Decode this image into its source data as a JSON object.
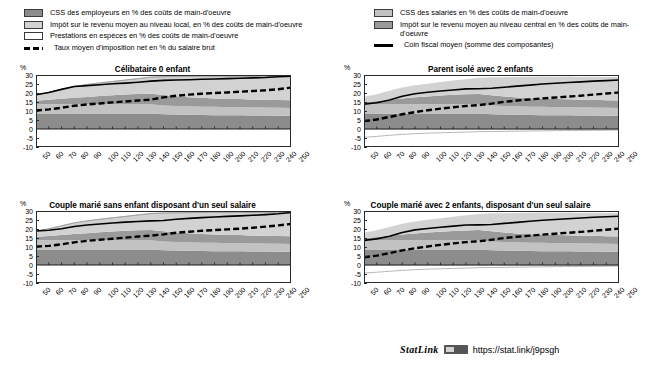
{
  "legend": {
    "left_items": [
      {
        "swatch": "dark",
        "label": "CSS des employeurs en % des coûts de main-d'oeuvre"
      },
      {
        "swatch": "lightgray",
        "label": "Impôt sur le revenu moyen au niveau local, en % des coûts de main-d'oeuvre"
      },
      {
        "swatch": "white",
        "label": "Prestations en espèces en % des coûts de main-d'oeuvre"
      },
      {
        "swatch": "dash",
        "label": "Taux moyen d'imposition net en % du salaire brut"
      }
    ],
    "right_items": [
      {
        "swatch": "midlight",
        "label": "CSS des salariés en % des coûts de main-d'oeuvre"
      },
      {
        "swatch": "mid",
        "label": "Impôt sur le revenu moyen au niveau central en %  des coûts de main-d'oeuvre"
      },
      {
        "swatch": "line",
        "label": "Coin fiscal moyen (somme des composantes)"
      }
    ]
  },
  "axis": {
    "unit": "%",
    "yticks": [
      30,
      25,
      20,
      15,
      10,
      5,
      0,
      -5,
      -10
    ],
    "ylim": [
      -10,
      30
    ],
    "xticks": [
      "50",
      "60",
      "70",
      "80",
      "90",
      "100",
      "110",
      "120",
      "130",
      "140",
      "150",
      "160",
      "170",
      "180",
      "190",
      "200",
      "210",
      "220",
      "230",
      "240",
      "250"
    ]
  },
  "footer": {
    "statlink_word": "StatLink",
    "icon": "spreadsheet-icon",
    "url": "https://stat.link/j9psgh"
  },
  "colors": {
    "employer_scc": "#8c8c8c",
    "employee_scc": "#c2c2c2",
    "central_tax": "#9a9a9a",
    "local_tax": "#d2d2d2",
    "cash_benefits": "#ffffff",
    "net_rate_line": "#000000",
    "wedge_line": "#000000"
  },
  "chart_data": [
    {
      "id": "celibataire-0-enfant",
      "type": "area",
      "title": "Célibataire 0 enfant",
      "xlabel": "",
      "ylabel": "%",
      "ylim": [
        -10,
        30
      ],
      "grid": false,
      "legend_position": "top",
      "x": [
        50,
        60,
        70,
        80,
        90,
        100,
        110,
        120,
        130,
        140,
        150,
        160,
        170,
        180,
        190,
        200,
        210,
        220,
        230,
        240,
        250
      ],
      "series": [
        {
          "name": "CSS des employeurs en % des coûts de main-d'oeuvre",
          "stack": true,
          "order": 1,
          "values": [
            8.6,
            8.6,
            8.6,
            8.6,
            8.6,
            8.6,
            8.6,
            8.6,
            8.6,
            8.6,
            8.2,
            8.0,
            7.9,
            7.8,
            7.7,
            7.6,
            7.6,
            7.5,
            7.5,
            7.4,
            7.4
          ]
        },
        {
          "name": "CSS des salariés en % des coûts de main-d'oeuvre",
          "stack": true,
          "order": 2,
          "values": [
            5.1,
            5.1,
            5.1,
            5.1,
            5.1,
            5.1,
            5.1,
            5.1,
            5.1,
            5.1,
            4.9,
            4.8,
            4.7,
            4.6,
            4.6,
            4.5,
            4.5,
            4.4,
            4.4,
            4.4,
            4.3
          ]
        },
        {
          "name": "Impôt sur le revenu moyen au niveau central en % des coûts de main-d'oeuvre",
          "stack": true,
          "order": 3,
          "values": [
            2.0,
            2.5,
            3.1,
            3.6,
            4.1,
            4.6,
            5.0,
            5.4,
            5.7,
            5.9,
            5.8,
            5.4,
            5.1,
            4.9,
            4.7,
            4.6,
            4.5,
            4.4,
            4.4,
            4.3,
            4.3
          ]
        },
        {
          "name": "Impôt sur le revenu moyen au niveau local en % des coûts de main-d'oeuvre",
          "stack": true,
          "order": 4,
          "values": [
            3.3,
            4.1,
            5.2,
            6.3,
            6.9,
            7.3,
            7.7,
            8.1,
            8.6,
            9.2,
            10.2,
            11.0,
            11.6,
            12.1,
            12.4,
            12.6,
            12.8,
            12.9,
            13.0,
            13.1,
            13.2
          ]
        },
        {
          "name": "Prestations en espèces en % des coûts de main-d'oeuvre",
          "stack": true,
          "order": 5,
          "values": [
            0,
            0,
            0,
            0,
            0,
            0,
            0,
            0,
            0,
            0,
            0,
            0,
            0,
            0,
            0,
            0,
            0,
            0,
            0,
            0,
            0
          ]
        }
      ],
      "lines": [
        {
          "name": "Coin fiscal moyen (somme des composantes)",
          "style": "solid",
          "values": [
            19.0,
            20.3,
            22.0,
            23.6,
            24.1,
            24.6,
            25.1,
            25.5,
            26.0,
            26.6,
            27.0,
            27.2,
            27.4,
            27.6,
            27.8,
            28.0,
            28.2,
            28.4,
            28.6,
            29.0,
            29.4
          ]
        },
        {
          "name": "Taux moyen d'imposition net en % du salaire brut",
          "style": "dashed",
          "values": [
            10.3,
            10.9,
            11.8,
            12.9,
            13.6,
            14.2,
            14.8,
            15.3,
            15.8,
            16.3,
            17.6,
            18.5,
            19.1,
            19.6,
            20.0,
            20.3,
            20.7,
            21.1,
            21.5,
            22.1,
            23.0
          ]
        }
      ]
    },
    {
      "id": "parent-isole-2-enfants",
      "type": "area",
      "title": "Parent isolé avec 2 enfants",
      "xlabel": "",
      "ylabel": "%",
      "ylim": [
        -10,
        30
      ],
      "grid": false,
      "legend_position": "top",
      "x": [
        50,
        60,
        70,
        80,
        90,
        100,
        110,
        120,
        130,
        140,
        150,
        160,
        170,
        180,
        190,
        200,
        210,
        220,
        230,
        240,
        250
      ],
      "series": [
        {
          "name": "CSS des employeurs en % des coûts de main-d'oeuvre",
          "stack": true,
          "order": 1,
          "values": [
            8.6,
            8.6,
            8.6,
            8.6,
            8.6,
            8.6,
            8.6,
            8.6,
            8.6,
            8.6,
            8.2,
            8.0,
            7.9,
            7.8,
            7.7,
            7.6,
            7.6,
            7.5,
            7.5,
            7.4,
            7.4
          ]
        },
        {
          "name": "CSS des salariés en % des coûts de main-d'oeuvre",
          "stack": true,
          "order": 2,
          "values": [
            5.1,
            5.1,
            5.1,
            5.1,
            5.1,
            5.1,
            5.1,
            5.1,
            5.1,
            5.1,
            4.9,
            4.8,
            4.7,
            4.6,
            4.6,
            4.5,
            4.5,
            4.4,
            4.4,
            4.4,
            4.3
          ]
        },
        {
          "name": "Impôt sur le revenu moyen au niveau central en % des coûts de main-d'oeuvre",
          "stack": true,
          "order": 3,
          "values": [
            1.2,
            1.8,
            2.6,
            3.3,
            3.9,
            4.4,
            4.9,
            5.3,
            5.6,
            5.8,
            5.6,
            5.2,
            4.9,
            4.7,
            4.6,
            4.5,
            4.4,
            4.3,
            4.3,
            4.2,
            4.2
          ]
        },
        {
          "name": "Impôt sur le revenu moyen au niveau local en % des coûts de main-d'oeuvre",
          "stack": true,
          "order": 4,
          "values": [
            3.0,
            3.8,
            4.9,
            6.0,
            6.7,
            7.1,
            7.5,
            7.9,
            8.4,
            9.0,
            10.0,
            10.8,
            11.4,
            11.9,
            12.2,
            12.4,
            12.6,
            12.7,
            12.8,
            12.9,
            13.0
          ]
        },
        {
          "name": "Prestations en espèces en % des coûts de main-d'oeuvre",
          "stack": true,
          "order": 5,
          "values": [
            -4.6,
            -4.1,
            -3.5,
            -3.0,
            -2.6,
            -2.3,
            -2.1,
            -1.9,
            -1.7,
            -1.5,
            -1.4,
            -1.3,
            -1.2,
            -1.1,
            -1.0,
            -0.9,
            -0.8,
            -0.8,
            -0.7,
            -0.7,
            -0.6
          ]
        }
      ],
      "lines": [
        {
          "name": "Coin fiscal moyen (somme des composantes)",
          "style": "solid",
          "values": [
            13.8,
            14.6,
            16.1,
            18.2,
            19.6,
            20.4,
            21.1,
            21.7,
            22.3,
            22.4,
            22.6,
            23.2,
            23.8,
            24.4,
            25.0,
            25.4,
            25.8,
            26.2,
            26.6,
            26.9,
            27.2
          ]
        },
        {
          "name": "Taux moyen d'imposition net en % du salaire brut",
          "style": "dashed",
          "values": [
            4.4,
            5.3,
            6.7,
            8.2,
            9.4,
            10.4,
            11.3,
            12.1,
            12.8,
            13.3,
            14.1,
            15.1,
            15.8,
            16.4,
            17.0,
            17.5,
            18.0,
            18.5,
            19.1,
            19.7,
            20.3
          ]
        }
      ]
    },
    {
      "id": "couple-marie-sans-enfant",
      "type": "area",
      "title": "Couple marié sans enfant disposant d'un seul salaire",
      "xlabel": "",
      "ylabel": "%",
      "ylim": [
        -10,
        30
      ],
      "grid": false,
      "legend_position": "top",
      "x": [
        50,
        60,
        70,
        80,
        90,
        100,
        110,
        120,
        130,
        140,
        150,
        160,
        170,
        180,
        190,
        200,
        210,
        220,
        230,
        240,
        250
      ],
      "series": [
        {
          "name": "CSS des employeurs en % des coûts de main-d'oeuvre",
          "stack": true,
          "order": 1,
          "values": [
            8.6,
            8.6,
            8.6,
            8.6,
            8.6,
            8.6,
            8.6,
            8.6,
            8.6,
            8.6,
            8.2,
            8.0,
            7.9,
            7.8,
            7.7,
            7.6,
            7.6,
            7.5,
            7.5,
            7.4,
            7.4
          ]
        },
        {
          "name": "CSS des salariés en % des coûts de main-d'oeuvre",
          "stack": true,
          "order": 2,
          "values": [
            5.1,
            5.1,
            5.1,
            5.1,
            5.1,
            5.1,
            5.1,
            5.1,
            5.1,
            5.1,
            4.9,
            4.8,
            4.7,
            4.6,
            4.6,
            4.5,
            4.5,
            4.4,
            4.4,
            4.4,
            4.3
          ]
        },
        {
          "name": "Impôt sur le revenu moyen au niveau central en % des coûts de main-d'oeuvre",
          "stack": true,
          "order": 3,
          "values": [
            2.0,
            2.4,
            3.0,
            3.5,
            4.0,
            4.5,
            4.9,
            5.3,
            5.6,
            5.8,
            5.7,
            5.3,
            5.0,
            4.8,
            4.7,
            4.6,
            4.5,
            4.4,
            4.4,
            4.3,
            4.3
          ]
        },
        {
          "name": "Impôt sur le revenu moyen au niveau local en % des coûts de main-d'oeuvre",
          "stack": true,
          "order": 4,
          "values": [
            3.2,
            4.0,
            5.1,
            6.2,
            6.8,
            7.2,
            7.6,
            8.0,
            8.5,
            9.1,
            10.1,
            10.9,
            11.5,
            12.0,
            12.3,
            12.5,
            12.7,
            12.8,
            13.0,
            13.2,
            13.4
          ]
        },
        {
          "name": "Prestations en espèces en % des coûts de main-d'oeuvre",
          "stack": true,
          "order": 5,
          "values": [
            0,
            0,
            0,
            0,
            0,
            0,
            0,
            0,
            0,
            0,
            0,
            0,
            0,
            0,
            0,
            0,
            0,
            0,
            0,
            0,
            0
          ]
        }
      ],
      "lines": [
        {
          "name": "Coin fiscal moyen (somme des composantes)",
          "style": "solid",
          "values": [
            18.9,
            19.3,
            20.1,
            21.4,
            22.2,
            22.8,
            23.3,
            23.8,
            24.2,
            24.5,
            24.7,
            25.4,
            25.9,
            26.3,
            26.7,
            27.0,
            27.3,
            27.6,
            28.0,
            28.5,
            29.2
          ]
        },
        {
          "name": "Taux moyen d'imposition net en % du salaire brut",
          "style": "dashed",
          "values": [
            10.2,
            10.6,
            11.5,
            12.6,
            13.4,
            14.0,
            14.6,
            15.2,
            15.8,
            16.3,
            17.0,
            17.9,
            18.5,
            19.0,
            19.4,
            19.8,
            20.2,
            20.7,
            21.3,
            22.0,
            22.8
          ]
        }
      ]
    },
    {
      "id": "couple-marie-2-enfants",
      "type": "area",
      "title": "Couple marié avec 2 enfants, disposant d'un seul salaire",
      "xlabel": "",
      "ylabel": "%",
      "ylim": [
        -10,
        30
      ],
      "grid": false,
      "legend_position": "top",
      "x": [
        50,
        60,
        70,
        80,
        90,
        100,
        110,
        120,
        130,
        140,
        150,
        160,
        170,
        180,
        190,
        200,
        210,
        220,
        230,
        240,
        250
      ],
      "series": [
        {
          "name": "CSS des employeurs en % des coûts de main-d'oeuvre",
          "stack": true,
          "order": 1,
          "values": [
            8.6,
            8.6,
            8.6,
            8.6,
            8.6,
            8.6,
            8.6,
            8.6,
            8.6,
            8.6,
            8.2,
            8.0,
            7.9,
            7.8,
            7.7,
            7.6,
            7.6,
            7.5,
            7.5,
            7.4,
            7.4
          ]
        },
        {
          "name": "CSS des salariés en % des coûts de main-d'oeuvre",
          "stack": true,
          "order": 2,
          "values": [
            5.1,
            5.1,
            5.1,
            5.1,
            5.1,
            5.1,
            5.1,
            5.1,
            5.1,
            5.1,
            4.9,
            4.8,
            4.7,
            4.6,
            4.6,
            4.5,
            4.5,
            4.4,
            4.4,
            4.4,
            4.3
          ]
        },
        {
          "name": "Impôt sur le revenu moyen au niveau central en % des coûts de main-d'oeuvre",
          "stack": true,
          "order": 3,
          "values": [
            1.2,
            1.8,
            2.5,
            3.2,
            3.8,
            4.3,
            4.8,
            5.2,
            5.5,
            5.7,
            5.6,
            5.2,
            4.9,
            4.7,
            4.6,
            4.5,
            4.4,
            4.3,
            4.3,
            4.2,
            4.2
          ]
        },
        {
          "name": "Impôt sur le revenu moyen au niveau local en % des coûts de main-d'oeuvre",
          "stack": true,
          "order": 4,
          "values": [
            3.0,
            3.8,
            4.9,
            6.0,
            6.6,
            7.1,
            7.5,
            7.9,
            8.4,
            9.0,
            10.0,
            10.8,
            11.4,
            11.9,
            12.2,
            12.4,
            12.6,
            12.7,
            12.8,
            12.9,
            13.0
          ]
        },
        {
          "name": "Prestations en espèces en % des coûts de main-d'oeuvre",
          "stack": true,
          "order": 5,
          "values": [
            -4.5,
            -4.0,
            -3.5,
            -3.0,
            -2.6,
            -2.3,
            -2.1,
            -1.9,
            -1.7,
            -1.5,
            -1.4,
            -1.3,
            -1.2,
            -1.1,
            -1.0,
            -0.9,
            -0.8,
            -0.8,
            -0.7,
            -0.7,
            -0.6
          ]
        }
      ],
      "lines": [
        {
          "name": "Coin fiscal moyen (somme des composantes)",
          "style": "solid",
          "values": [
            13.7,
            14.5,
            16.0,
            18.1,
            19.5,
            20.3,
            21.0,
            21.6,
            22.2,
            22.3,
            22.5,
            23.1,
            23.7,
            24.3,
            24.9,
            25.3,
            25.7,
            26.1,
            26.5,
            26.8,
            27.1
          ]
        },
        {
          "name": "Taux moyen d'imposition net en % du salaire brut",
          "style": "dashed",
          "values": [
            4.3,
            5.2,
            6.6,
            8.1,
            9.3,
            10.3,
            11.2,
            12.0,
            12.7,
            13.2,
            14.0,
            15.0,
            15.7,
            16.3,
            16.9,
            17.4,
            17.9,
            18.4,
            19.0,
            19.6,
            20.2
          ]
        }
      ]
    }
  ]
}
